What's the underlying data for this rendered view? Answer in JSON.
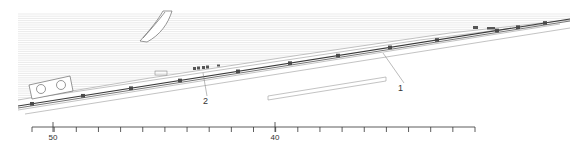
{
  "drawing": {
    "type": "site-section-plan",
    "colors": {
      "hatch": "#d4d4d4",
      "line": "#7a7a7a",
      "track": "#3a3a3a",
      "text": "#333333"
    },
    "callouts": [
      {
        "id": "1",
        "text": "1",
        "label_x": 398,
        "label_y": 84,
        "leader_from": [
          404,
          83
        ],
        "leader_to": [
          383,
          53
        ]
      },
      {
        "id": "2",
        "text": "2",
        "label_x": 203,
        "label_y": 97,
        "leader_from": [
          207,
          96
        ],
        "leader_to": [
          203,
          73
        ]
      }
    ]
  },
  "scale_bar": {
    "x_start": 32,
    "x_end": 475,
    "y": 127,
    "tick_spacing": 22.15,
    "tick_count": 21,
    "labels": [
      {
        "text": "50",
        "x": 53
      },
      {
        "text": "40",
        "x": 275
      }
    ],
    "major_tick_x": [
      53,
      275
    ]
  }
}
